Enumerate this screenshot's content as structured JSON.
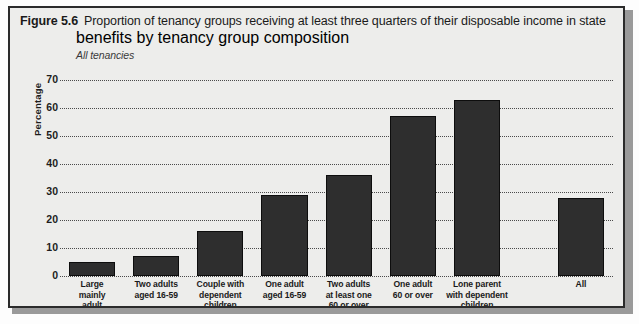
{
  "figure": {
    "number": "Figure 5.6",
    "title": "Proportion of tenancy groups receiving at least three quarters of their disposable income in state",
    "title_line2": "benefits by tenancy group composition",
    "subtitle": "All tenancies"
  },
  "chart_data": {
    "type": "bar",
    "title": "Proportion of tenancy groups receiving at least three quarters of their disposable income in state benefits by tenancy group composition",
    "subtitle": "All tenancies",
    "xlabel": "",
    "ylabel": "Percentage",
    "ylim": [
      0,
      70
    ],
    "yticks": [
      0,
      10,
      20,
      30,
      40,
      50,
      60,
      70
    ],
    "grid": true,
    "legend": false,
    "bar_color": "#2e2e2e",
    "categories": [
      "Large mainly adult",
      "Two adults aged 16-59",
      "Couple with dependent children",
      "One adult aged 16-59",
      "Two adults at least one 60 or over",
      "One adult 60 or over",
      "Lone parent with dependent children",
      "All"
    ],
    "category_lines": [
      [
        "Large",
        "mainly",
        "adult"
      ],
      [
        "Two adults",
        "aged 16-59"
      ],
      [
        "Couple with",
        "dependent",
        "children"
      ],
      [
        "One adult",
        "aged 16-59"
      ],
      [
        "Two adults",
        "at least one",
        "60 or over"
      ],
      [
        "One adult",
        "60 or over"
      ],
      [
        "Lone parent",
        "with dependent",
        "children"
      ],
      [
        "All"
      ]
    ],
    "values": [
      5,
      7,
      16,
      29,
      36,
      57,
      63,
      28
    ]
  }
}
